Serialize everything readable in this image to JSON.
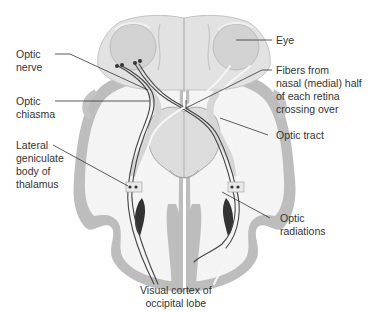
{
  "diagram": {
    "type": "anatomical-illustration",
    "colors": {
      "background": "#ffffff",
      "brain_tissue": "#e6e6e6",
      "brain_shadow": "#c8c8c8",
      "cortex_band": "#bdbdbd",
      "eye": "#cfcfcf",
      "fiber_dark": "#444444",
      "fiber_light": "#f4f4f4",
      "leader_line": "#333333",
      "text": "#333333"
    }
  },
  "labels": {
    "optic_nerve": "Optic\nnerve",
    "optic_chiasma": "Optic\nchiasma",
    "lateral_geniculate": "Lateral\ngeniculate\nbody of\nthalamus",
    "eye": "Eye",
    "fibers_crossing": "Fibers from\nnasal (medial) half\nof each retina\ncrossing over",
    "optic_tract": "Optic tract",
    "optic_radiations": "Optic\nradiations",
    "visual_cortex": "Visual cortex of\noccipital lobe"
  }
}
